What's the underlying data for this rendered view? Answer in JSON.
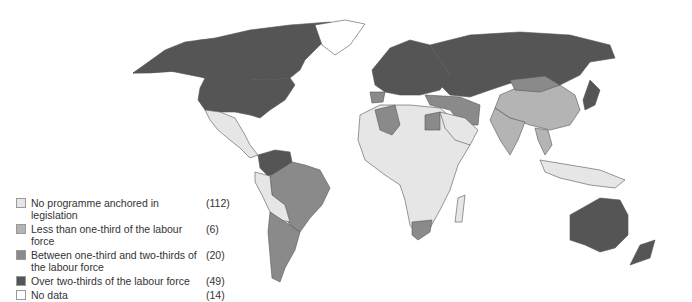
{
  "map": {
    "title": "",
    "categories": [
      {
        "label": "No programme anchored in legislation",
        "count": "(112)",
        "color": "#e6e6e6"
      },
      {
        "label": "Less than one-third of the labour force",
        "count": "(6)",
        "color": "#b4b4b4"
      },
      {
        "label": "Between one-third and two-thirds of the labour force",
        "count": "(20)",
        "color": "#8a8a8a"
      },
      {
        "label": "Over two-thirds of the labour force",
        "count": "(49)",
        "color": "#555555"
      },
      {
        "label": "No data",
        "count": "(14)",
        "color": "#ffffff"
      }
    ]
  },
  "legend": {
    "items": [
      {
        "label": "No programme anchored in legislation",
        "count": "(112)"
      },
      {
        "label": "Less than one-third of the labour force",
        "count": "(6)"
      },
      {
        "label": "Between one-third and two-thirds of the labour force",
        "count": "(20)"
      },
      {
        "label": "Over two-thirds of the labour force",
        "count": "(49)"
      },
      {
        "label": "No data",
        "count": "(14)"
      }
    ]
  }
}
